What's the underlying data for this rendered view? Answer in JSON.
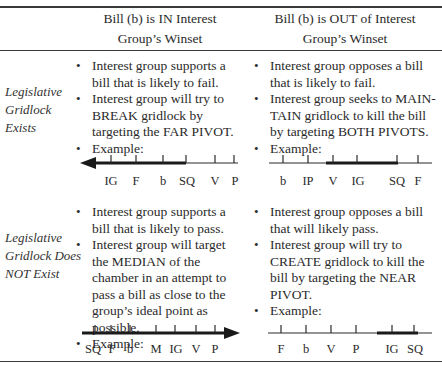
{
  "header": {
    "col1": [
      "Bill (b) is IN Interest",
      "Group’s Winset"
    ],
    "col2": [
      "Bill (b) is OUT of Interest",
      "Group’s Winset"
    ]
  },
  "rows": [
    {
      "label": [
        "Legislative",
        "Gridlock",
        "Exists"
      ],
      "in_winset": {
        "bullets": [
          "Interest group supports a bill that is likely to fail.",
          "Interest group will try to BREAK gridlock by targeting the FAR PIVOT.",
          "Example:"
        ]
      },
      "out_winset": {
        "bullets": [
          "Interest group opposes a bill that is likely to fail.",
          "Interest group seeks to MAIN-TAIN gridlock to kill the bill by targeting BOTH PIVOTS.",
          "Example:"
        ]
      }
    },
    {
      "label": [
        "Legislative",
        "Gridlock Does",
        "NOT Exist"
      ],
      "in_winset": {
        "bullets": [
          "Interest group supports a bill that is likely to pass.",
          "Interest group will target the MEDIAN of the chamber in an attempt to pass a bill as close to the group’s ideal point as possible.",
          "Example:"
        ]
      },
      "out_winset": {
        "bullets": [
          "Interest group opposes a bill that will likely pass.",
          "Interest group will try to CREATE gridlock to kill the bill by targeting the NEAR PIVOT.",
          "Example:"
        ]
      }
    }
  ],
  "diagrams": {
    "gridlock_in": {
      "labels": [
        "IG",
        "F",
        "b",
        "SQ",
        "V",
        "P"
      ],
      "arrow_direction": "left",
      "highlight": "arrow from SQ leftward"
    },
    "gridlock_out": {
      "labels": [
        "b",
        "IP",
        "V",
        "IG",
        "SQ",
        "F"
      ],
      "arrow_direction": "none",
      "highlight": "thick segment from V to SQ"
    },
    "no_gridlock_in": {
      "labels": [
        "SQ",
        "F",
        "b",
        "M",
        "IG",
        "V",
        "P"
      ],
      "arrow_direction": "right",
      "highlight": "arrow across entire line to the right"
    },
    "no_gridlock_out": {
      "labels": [
        "F",
        "b",
        "V",
        "P",
        "IG",
        "SQ"
      ],
      "arrow_direction": "none",
      "highlight": "thick segment from IG to SQ"
    }
  },
  "colors": {
    "ink": "#2a2a2a",
    "rule": "#3a3a3a",
    "background": "#ffffff"
  }
}
